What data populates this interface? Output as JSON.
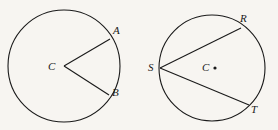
{
  "figure": {
    "name": "two-circles-geometry-figure",
    "background_color": "#f7f5f1",
    "stroke_color": "#1a1a1a",
    "width": 278,
    "height": 130
  },
  "left_circle": {
    "name": "circle-with-central-angle",
    "center": {
      "x": 64,
      "y": 66
    },
    "radius": 56,
    "center_label": "C",
    "center_label_pos": {
      "x": 48,
      "y": 61
    },
    "points": [
      {
        "label": "A",
        "label_pos": {
          "x": 113,
          "y": 25
        },
        "on_circle": {
          "x": 110,
          "y": 39
        }
      },
      {
        "label": "B",
        "label_pos": {
          "x": 112,
          "y": 87
        },
        "on_circle": {
          "x": 109,
          "y": 95
        }
      }
    ],
    "segments": [
      {
        "name": "radius-CA",
        "from": "C",
        "to": "A"
      },
      {
        "name": "radius-CB",
        "from": "C",
        "to": "B"
      }
    ]
  },
  "right_circle": {
    "name": "circle-with-inscribed-angle",
    "center": {
      "x": 212,
      "y": 68
    },
    "radius": 53,
    "center_label": "C",
    "center_label_pos": {
      "x": 202,
      "y": 62
    },
    "center_dot": {
      "x": 215,
      "y": 68
    },
    "points": [
      {
        "label": "R",
        "label_pos": {
          "x": 240,
          "y": 13
        },
        "on_circle": {
          "x": 241,
          "y": 28
        }
      },
      {
        "label": "S",
        "label_pos": {
          "x": 148,
          "y": 62
        },
        "on_circle": {
          "x": 160,
          "y": 68
        }
      },
      {
        "label": "T",
        "label_pos": {
          "x": 251,
          "y": 104
        },
        "on_circle": {
          "x": 249,
          "y": 105
        }
      }
    ],
    "segments": [
      {
        "name": "chord-SR",
        "from": "S",
        "to": "R"
      },
      {
        "name": "chord-ST",
        "from": "S",
        "to": "T"
      }
    ]
  }
}
